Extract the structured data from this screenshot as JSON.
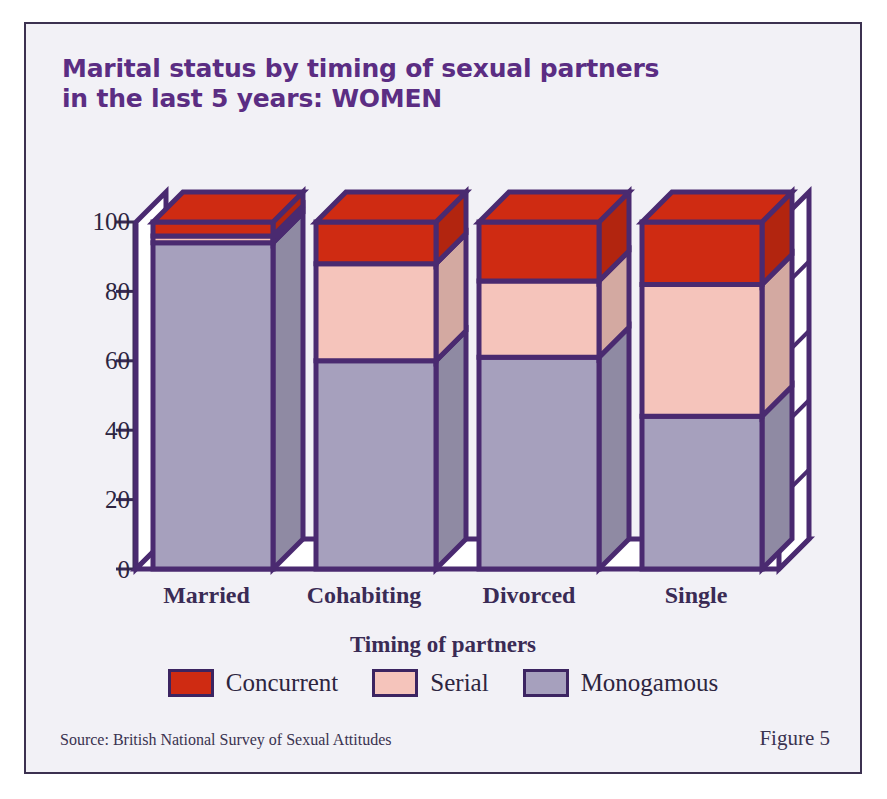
{
  "figure": {
    "title_line1": "Marital status by timing of sexual partners",
    "title_line2": "in the last 5 years: WOMEN",
    "title_color": "#5b2d83",
    "source": "Source: British National Survey of Sexual Attitudes",
    "figure_number": "Figure 5"
  },
  "legend": {
    "title": "Timing of partners",
    "items": [
      {
        "label": "Concurrent",
        "color": "#cf2b12"
      },
      {
        "label": "Serial",
        "color": "#f5c4bb"
      },
      {
        "label": "Monogamous",
        "color": "#a6a0bd"
      }
    ]
  },
  "chart_data": {
    "type": "bar",
    "subtype": "stacked-3d-column",
    "title": "Marital status by timing of sexual partners in the last 5 years: WOMEN",
    "xlabel": "",
    "ylabel": "",
    "ylim": [
      0,
      100
    ],
    "yticks": [
      "0",
      "20",
      "40",
      "60",
      "80",
      "100"
    ],
    "ytick_values": [
      0,
      20,
      40,
      60,
      80,
      100
    ],
    "grid": false,
    "legend_position": "bottom",
    "categories": [
      "Married",
      "Cohabiting",
      "Divorced",
      "Single"
    ],
    "series": [
      {
        "name": "Monogamous",
        "color": "#a6a0bd",
        "values": [
          94,
          60,
          61,
          44
        ]
      },
      {
        "name": "Serial",
        "color": "#f5c4bb",
        "values": [
          2,
          28,
          22,
          38
        ]
      },
      {
        "name": "Concurrent",
        "color": "#cf2b12",
        "values": [
          4,
          12,
          17,
          18
        ]
      }
    ]
  },
  "axis": {
    "tick_0": "0",
    "tick_20": "20",
    "tick_40": "40",
    "tick_60": "60",
    "tick_80": "80",
    "tick_100": "100"
  },
  "categories": {
    "c0": "Married",
    "c1": "Cohabiting",
    "c2": "Divorced",
    "c3": "Single"
  }
}
